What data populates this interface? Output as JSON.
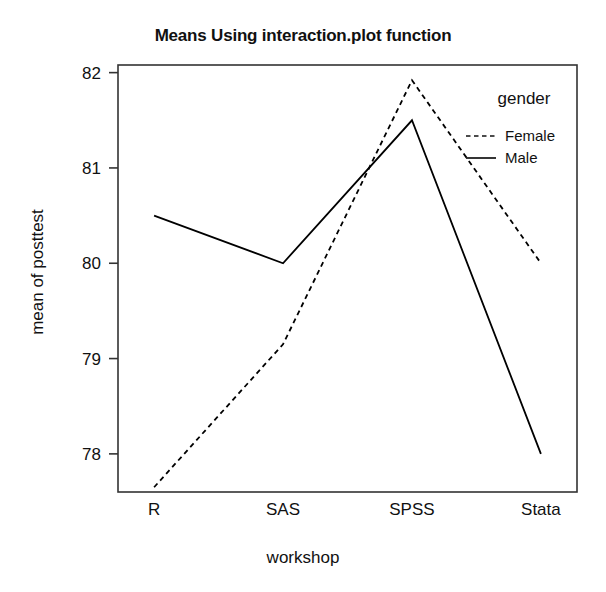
{
  "chart_data": {
    "type": "line",
    "title": "Means Using interaction.plot function",
    "xlabel": "workshop",
    "ylabel": "mean of posttest",
    "categories": [
      "R",
      "SAS",
      "SPSS",
      "Stata"
    ],
    "series": [
      {
        "name": "Female",
        "style": "dashed",
        "color": "#000000",
        "values": [
          77.65,
          79.15,
          81.92,
          80.0
        ]
      },
      {
        "name": "Male",
        "style": "solid",
        "color": "#000000",
        "values": [
          80.5,
          80.0,
          81.5,
          78.0
        ]
      }
    ],
    "yticks": [
      "78",
      "79",
      "80",
      "81",
      "82"
    ],
    "ytick_values": [
      78,
      79,
      80,
      81,
      82
    ],
    "ylim": [
      77.6,
      82.08
    ],
    "xlim": [
      0.72,
      4.28
    ],
    "grid": false,
    "legend": {
      "title": "gender",
      "position": "top-right-inside",
      "entries": [
        {
          "label": "Female",
          "style": "dashed"
        },
        {
          "label": "Male",
          "style": "solid"
        }
      ]
    }
  },
  "axes": {
    "x_tick_labels": [
      "R",
      "SAS",
      "SPSS",
      "Stata"
    ],
    "y_tick_labels": [
      "82",
      "81",
      "80",
      "79",
      "78"
    ]
  }
}
